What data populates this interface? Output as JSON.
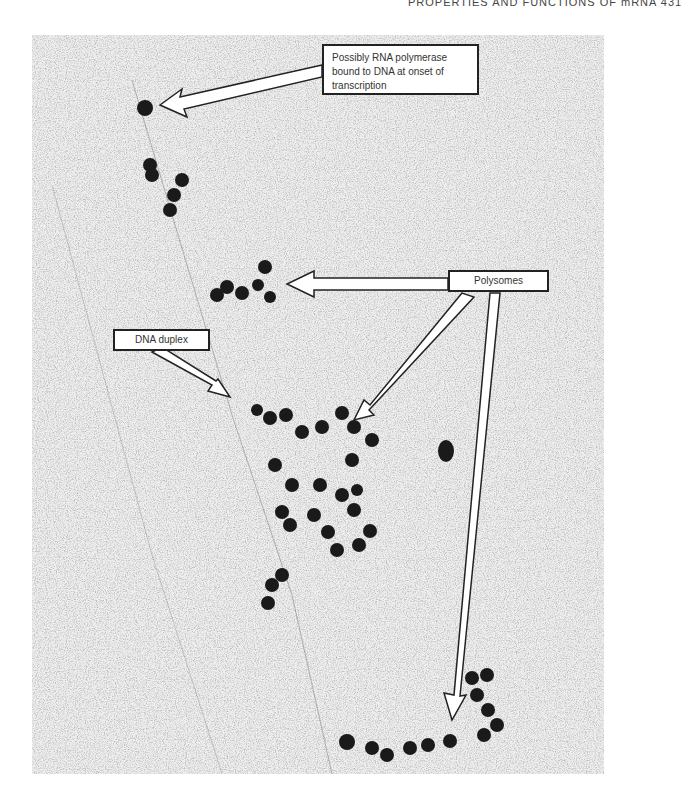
{
  "running_head": "PROPERTIES AND FUNCTIONS OF mRNA 431",
  "figure": {
    "type": "electron micrograph",
    "labels": {
      "rna_polymerase": "Possibly RNA polymerase bound to DNA at onset of transcription",
      "dna_duplex": "DNA duplex",
      "polysomes": "Polysomes"
    }
  }
}
